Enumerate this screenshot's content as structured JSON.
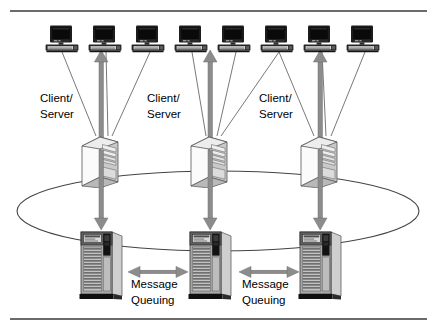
{
  "figure": {
    "top_rule_label": "top-divider",
    "bottom_rule_label": "bottom-divider"
  },
  "colors": {
    "background": "#ffffff",
    "rule": "#3a3a3a",
    "thin_line": "#555555",
    "ring": "#444444",
    "arrow_fill": "#8c8c8c",
    "arrow_stroke": "#6f6f6f",
    "monitor_dark": "#1c1c1c",
    "monitor_screen": "#0d0d0d",
    "monitor_base": "#3d3d3d",
    "monitor_keys": "#cfcfcf",
    "tower_front": "#fafafa",
    "tower_side": "#c9c9c9",
    "tower_outline": "#555555",
    "tower_bay": "#e2e2e2",
    "mainframe_body": "#a8a8a8",
    "mainframe_side": "#cdcdcd",
    "mainframe_top": "#6a6a6a",
    "mainframe_panel": "#d6d6d6",
    "mainframe_black": "#151515",
    "mainframe_slat": "#7a7a7a",
    "mainframe_base": "#101010"
  },
  "clients": {
    "icon": "desktop-computer-icon",
    "count": 8,
    "positions": [
      62,
      105,
      148,
      191,
      234,
      277,
      320,
      363
    ]
  },
  "client_server_labels": [
    {
      "line1": "Client/",
      "line2": "Server",
      "x": 40,
      "y": 99
    },
    {
      "line1": "Client/",
      "line2": "Server",
      "x": 146,
      "y": 99
    },
    {
      "line1": "Client/",
      "line2": "Server",
      "x": 256,
      "y": 99
    }
  ],
  "tier2_servers": {
    "icon": "tower-server-icon",
    "count": 3,
    "positions": [
      101,
      210,
      320
    ],
    "top": 136
  },
  "tier3_servers": {
    "icon": "mainframe-server-icon",
    "count": 3,
    "positions": [
      101,
      210,
      320
    ],
    "top": 228
  },
  "message_queuing_labels": [
    {
      "line1": "Message",
      "line2": "Queuing",
      "x": 131,
      "y": 283
    },
    {
      "line1": "Message",
      "line2": "Queuing",
      "x": 250,
      "y": 283
    }
  ],
  "ring": {
    "name": "network-ring",
    "cx": 218,
    "cy": 211,
    "rx": 201,
    "ry": 40
  },
  "vertical_arrows": [
    {
      "name": "client-to-server-arrow-up-left",
      "x": 101,
      "y1": 146,
      "y2": 56,
      "direction": "up"
    },
    {
      "name": "client-to-server-arrow-up-center",
      "x": 210,
      "y1": 146,
      "y2": 56,
      "direction": "up"
    },
    {
      "name": "client-to-server-arrow-up-right",
      "x": 320,
      "y1": 146,
      "y2": 56,
      "direction": "up"
    },
    {
      "name": "server-to-mainframe-arrow-down-left",
      "x": 101,
      "y1": 160,
      "y2": 226,
      "direction": "down"
    },
    {
      "name": "server-to-mainframe-arrow-down-center",
      "x": 210,
      "y1": 160,
      "y2": 226,
      "direction": "down"
    },
    {
      "name": "server-to-mainframe-arrow-down-right",
      "x": 320,
      "y1": 160,
      "y2": 226,
      "direction": "down"
    }
  ],
  "horizontal_arrows": [
    {
      "name": "message-queue-arrow-left-pair",
      "x1": 134,
      "x2": 181,
      "y": 272
    },
    {
      "name": "message-queue-arrow-right-pair",
      "x1": 246,
      "x2": 292,
      "y": 272
    }
  ],
  "connector_lines": [
    {
      "from": [
        62,
        56
      ],
      "to": [
        96,
        136
      ]
    },
    {
      "from": [
        105,
        56
      ],
      "to": [
        107,
        136
      ]
    },
    {
      "from": [
        148,
        56
      ],
      "to": [
        110,
        136
      ]
    },
    {
      "from": [
        191,
        56
      ],
      "to": [
        205,
        136
      ]
    },
    {
      "from": [
        234,
        56
      ],
      "to": [
        216,
        136
      ]
    },
    {
      "from": [
        277,
        56
      ],
      "to": [
        220,
        136
      ]
    },
    {
      "from": [
        277,
        56
      ],
      "to": [
        314,
        136
      ]
    },
    {
      "from": [
        320,
        56
      ],
      "to": [
        324,
        136
      ]
    },
    {
      "from": [
        363,
        56
      ],
      "to": [
        328,
        136
      ]
    }
  ]
}
